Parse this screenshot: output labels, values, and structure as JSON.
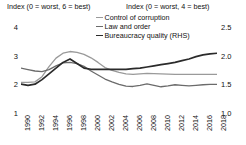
{
  "captions": {
    "left": "Index (0 = worst, 6 = best)",
    "right": "Index (0 = worst, 4 = best)"
  },
  "colors": {
    "control_of_corruption": "#9a9a9a",
    "law_and_order": "#6b6b6b",
    "bureaucracy_quality": "#2b2b2b",
    "axis": "#8a8a8a",
    "text": "#111111",
    "background": "#ffffff"
  },
  "legend": [
    {
      "label": "Control of corruption",
      "color": "#9a9a9a"
    },
    {
      "label": "Law and order",
      "color": "#6b6b6b"
    },
    {
      "label": "Bureaucracy quality (RHS)",
      "color": "#2b2b2b"
    }
  ],
  "chart_data": {
    "type": "line",
    "title": "",
    "xlabel": "",
    "ylabel": "Index (0 = worst, 6 = best)",
    "y2label": "Index (0 = worst, 4 = best)",
    "grid": false,
    "legend_position": "top-center",
    "x": [
      1990,
      1991,
      1992,
      1993,
      1994,
      1995,
      1996,
      1997,
      1998,
      1999,
      2000,
      2001,
      2002,
      2003,
      2004,
      2005,
      2006,
      2007,
      2008,
      2009,
      2010,
      2011,
      2012,
      2013,
      2014,
      2015,
      2016,
      2017,
      2018
    ],
    "xticks": [
      1990,
      1992,
      1994,
      1996,
      1998,
      2000,
      2002,
      2004,
      2006,
      2008,
      2010,
      2012,
      2014,
      2016,
      2018
    ],
    "xlim": [
      1990,
      2018
    ],
    "yticks_left": [
      1,
      2,
      3,
      4
    ],
    "ylim_left": [
      1,
      4
    ],
    "yticks_right": [
      "1.0",
      "1.5",
      "2.0",
      "2.5"
    ],
    "ylim_right": [
      1.0,
      2.5
    ],
    "series": [
      {
        "name": "Control of corruption",
        "axis": "left",
        "color": "#9a9a9a",
        "values": [
          2.1,
          2.1,
          2.12,
          2.3,
          2.65,
          2.95,
          3.12,
          3.18,
          3.15,
          3.08,
          2.96,
          2.8,
          2.62,
          2.52,
          2.45,
          2.4,
          2.38,
          2.4,
          2.42,
          2.41,
          2.4,
          2.39,
          2.38,
          2.38,
          2.38,
          2.38,
          2.38,
          2.38,
          2.38
        ]
      },
      {
        "name": "Law and order",
        "axis": "left",
        "color": "#6b6b6b",
        "values": [
          2.6,
          2.55,
          2.5,
          2.48,
          2.55,
          2.68,
          2.78,
          2.8,
          2.76,
          2.66,
          2.5,
          2.36,
          2.22,
          2.12,
          2.03,
          1.97,
          1.96,
          2.0,
          2.05,
          2.0,
          1.95,
          1.98,
          2.02,
          2.0,
          1.98,
          2.0,
          2.02,
          2.03,
          2.03
        ]
      },
      {
        "name": "Bureaucracy quality (RHS)",
        "axis": "right",
        "color": "#2b2b2b",
        "values": [
          1.52,
          1.5,
          1.52,
          1.6,
          1.7,
          1.8,
          1.9,
          1.96,
          1.88,
          1.8,
          1.78,
          1.78,
          1.78,
          1.78,
          1.78,
          1.78,
          1.79,
          1.8,
          1.82,
          1.84,
          1.86,
          1.88,
          1.9,
          1.93,
          1.96,
          2.0,
          2.03,
          2.05,
          2.06
        ]
      }
    ]
  }
}
